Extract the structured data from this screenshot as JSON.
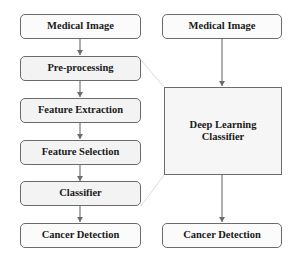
{
  "diagram": {
    "type": "flowchart-comparison",
    "left_pipeline": {
      "label": "Traditional pipeline",
      "steps": [
        "Medical Image",
        "Pre-processing",
        "Feature Extraction",
        "Feature Selection",
        "Classifier",
        "Cancer Detection"
      ]
    },
    "right_pipeline": {
      "label": "Deep learning pipeline",
      "steps": [
        "Medical Image",
        "Deep Learning Classifier",
        "Cancer Detection"
      ],
      "classifier_line1": "Deep Learning",
      "classifier_line2": "Classifier"
    },
    "colors": {
      "border": "#6b6b6b",
      "arrow": "#6b6b6b",
      "box_fill": "#fbfbfb",
      "bracket_line": "#dcdcdc",
      "text": "#1a1a1a"
    }
  }
}
